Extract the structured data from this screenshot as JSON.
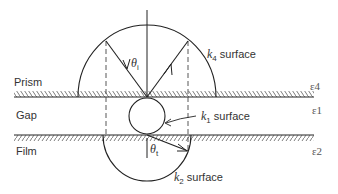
{
  "diagram": {
    "regions": [
      {
        "id": "prism",
        "label": "Prism",
        "epsilon": "ε4"
      },
      {
        "id": "gap",
        "label": "Gap",
        "epsilon": "ε1"
      },
      {
        "id": "film",
        "label": "Film",
        "epsilon": "ε2"
      }
    ],
    "surfaces": {
      "k4": {
        "var": "k",
        "sub": "4",
        "text": " surface"
      },
      "k1": {
        "var": "k",
        "sub": "1",
        "text": " surface"
      },
      "k2": {
        "var": "k",
        "sub": "2",
        "text": " surface"
      }
    },
    "angles": {
      "incident": {
        "sym": "θ",
        "sub": "i"
      },
      "transmitted": {
        "sym": "θ",
        "sub": "t"
      }
    },
    "colors": {
      "line": "#222222",
      "text": "#333333"
    }
  }
}
